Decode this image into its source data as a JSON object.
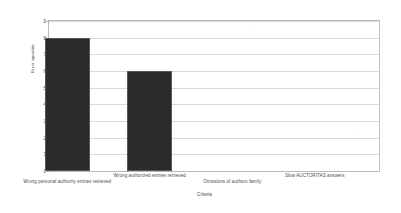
{
  "chart_data": {
    "type": "bar",
    "title": "",
    "xlabel": "Criteria",
    "ylabel": "Error quantity",
    "categories": [
      "Wrong personal authority entries retrieved",
      "Wrong authorized entries  retrieved",
      "Omissions of authors family",
      "Slow AUCTORITAS answers"
    ],
    "values": [
      8,
      6,
      0,
      0
    ],
    "ylim": [
      0,
      9
    ],
    "yticks": [
      0,
      1,
      2,
      3,
      4,
      5,
      6,
      7,
      8,
      9
    ],
    "ytick_labels": [
      "0",
      "1",
      "2",
      "3",
      "4",
      "5",
      "6",
      "7",
      "8",
      "9"
    ],
    "grid": true,
    "legend": false,
    "legend_position": "none",
    "bar_color": "#2b2b2b",
    "bar_edge_color": "#55565a",
    "grid_color": "#d9d9d9",
    "axis_color": "#b9b9b9",
    "background_color": "#ffffff",
    "text_color": "#4a4a4a"
  }
}
